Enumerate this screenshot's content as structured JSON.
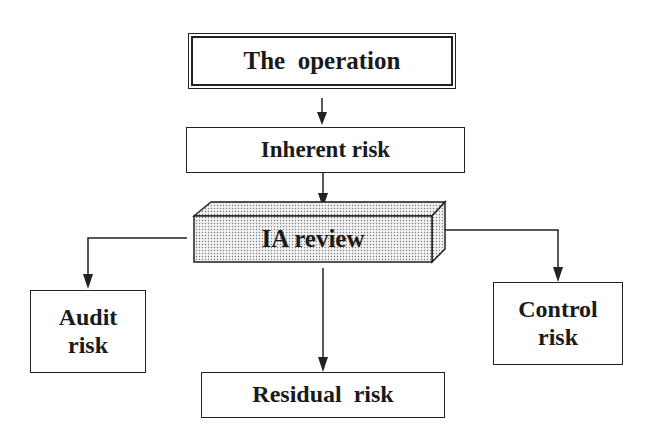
{
  "diagram": {
    "nodes": {
      "operation": {
        "label": "The  operation"
      },
      "inherent": {
        "label": "Inherent risk"
      },
      "ia_review": {
        "label": "IA review"
      },
      "audit": {
        "line1": "Audit",
        "line2": "risk"
      },
      "control": {
        "line1": "Control",
        "line2": "risk"
      },
      "residual": {
        "label": "Residual  risk"
      }
    },
    "edges": [
      {
        "from": "The operation",
        "to": "Inherent risk"
      },
      {
        "from": "Inherent risk",
        "to": "IA review"
      },
      {
        "from": "IA review",
        "to": "Audit risk"
      },
      {
        "from": "IA review",
        "to": "Control risk"
      },
      {
        "from": "IA review",
        "to": "Residual risk"
      }
    ],
    "colors": {
      "stroke": "#222222",
      "background": "#ffffff",
      "ia_fill": "#dcdcdc"
    }
  }
}
